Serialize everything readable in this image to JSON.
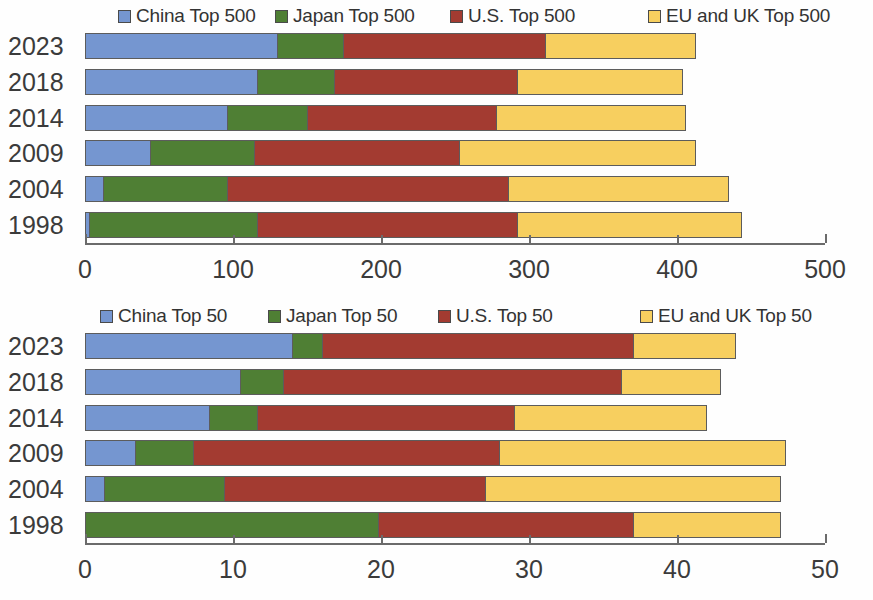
{
  "chart_data": [
    {
      "id": "top500",
      "type": "bar",
      "orientation": "horizontal",
      "stacked": true,
      "title": "",
      "xlabel": "",
      "ylabel": "",
      "grid": false,
      "legend_position": "top",
      "categories": [
        "2023",
        "2018",
        "2014",
        "2009",
        "2004",
        "1998"
      ],
      "xlim": [
        0,
        500
      ],
      "xticks": [
        0,
        100,
        200,
        300,
        400,
        500
      ],
      "xtick_labels": [
        "0",
        "100",
        "200",
        "300",
        "400",
        "500"
      ],
      "series": [
        {
          "name": "China Top 500",
          "color": "#7596d0",
          "values": [
            130,
            116,
            96,
            44,
            12,
            3
          ]
        },
        {
          "name": "Japan Top 500",
          "color": "#4f7f34",
          "values": [
            44,
            52,
            54,
            70,
            84,
            113
          ]
        },
        {
          "name": "U.S. Top 500",
          "color": "#a33b31",
          "values": [
            137,
            124,
            128,
            139,
            190,
            176
          ]
        },
        {
          "name": "EU and UK Top 500",
          "color": "#f7cf5f",
          "values": [
            102,
            112,
            128,
            160,
            149,
            152
          ]
        }
      ],
      "totals": [
        413,
        404,
        406,
        413,
        435,
        444
      ]
    },
    {
      "id": "top50",
      "type": "bar",
      "orientation": "horizontal",
      "stacked": true,
      "title": "",
      "xlabel": "",
      "ylabel": "",
      "grid": false,
      "legend_position": "top",
      "categories": [
        "2023",
        "2018",
        "2014",
        "2009",
        "2004",
        "1998"
      ],
      "xlim": [
        0,
        50
      ],
      "xticks": [
        0,
        10,
        20,
        30,
        40,
        50
      ],
      "xtick_labels": [
        "0",
        "10",
        "20",
        "30",
        "40",
        "50"
      ],
      "series": [
        {
          "name": "China Top 50",
          "color": "#7596d0",
          "values": [
            14,
            10.5,
            8.4,
            3.4,
            1.3,
            0
          ]
        },
        {
          "name": "Japan Top 50",
          "color": "#4f7f34",
          "values": [
            2,
            2.9,
            3.2,
            3.9,
            8.1,
            19.8
          ]
        },
        {
          "name": "U.S. Top 50",
          "color": "#a33b31",
          "values": [
            21,
            22.8,
            17.4,
            20.7,
            17.6,
            17.2
          ]
        },
        {
          "name": "EU and UK Top 50",
          "color": "#f7cf5f",
          "values": [
            7,
            6.8,
            13,
            19.4,
            20,
            10
          ]
        }
      ],
      "totals": [
        44,
        43,
        42,
        47.4,
        47,
        47
      ]
    }
  ],
  "charts": {
    "top": {
      "legend": [
        {
          "label": "China Top 500",
          "color": "#7596d0"
        },
        {
          "label": "Japan Top 500",
          "color": "#4f7f34"
        },
        {
          "label": "U.S. Top 500",
          "color": "#a33b31"
        },
        {
          "label": "EU and UK Top 500",
          "color": "#f7cf5f"
        }
      ],
      "rows": [
        {
          "year": "2023",
          "segments": [
            130,
            44,
            137,
            102
          ]
        },
        {
          "year": "2018",
          "segments": [
            116,
            52,
            124,
            112
          ]
        },
        {
          "year": "2014",
          "segments": [
            96,
            54,
            128,
            128
          ]
        },
        {
          "year": "2009",
          "segments": [
            44,
            70,
            139,
            160
          ]
        },
        {
          "year": "2004",
          "segments": [
            12,
            84,
            190,
            149
          ]
        },
        {
          "year": "1998",
          "segments": [
            3,
            113,
            176,
            152
          ]
        }
      ],
      "xticks": [
        "0",
        "100",
        "200",
        "300",
        "400",
        "500"
      ],
      "max": 500
    },
    "bottom": {
      "legend": [
        {
          "label": "China Top 50",
          "color": "#7596d0"
        },
        {
          "label": "Japan Top 50",
          "color": "#4f7f34"
        },
        {
          "label": "U.S. Top 50",
          "color": "#a33b31"
        },
        {
          "label": "EU and UK Top 50",
          "color": "#f7cf5f"
        }
      ],
      "rows": [
        {
          "year": "2023",
          "segments": [
            14,
            2,
            21,
            7
          ]
        },
        {
          "year": "2018",
          "segments": [
            10.5,
            2.9,
            22.8,
            6.8
          ]
        },
        {
          "year": "2014",
          "segments": [
            8.4,
            3.2,
            17.4,
            13
          ]
        },
        {
          "year": "2009",
          "segments": [
            3.4,
            3.9,
            20.7,
            19.4
          ]
        },
        {
          "year": "2004",
          "segments": [
            1.3,
            8.1,
            17.6,
            20
          ]
        },
        {
          "year": "1998",
          "segments": [
            0,
            19.8,
            17.2,
            10
          ]
        }
      ],
      "xticks": [
        "0",
        "10",
        "20",
        "30",
        "40",
        "50"
      ],
      "max": 50
    }
  },
  "geometry": {
    "axis_left_px": 85,
    "axis_right_px": 825
  }
}
